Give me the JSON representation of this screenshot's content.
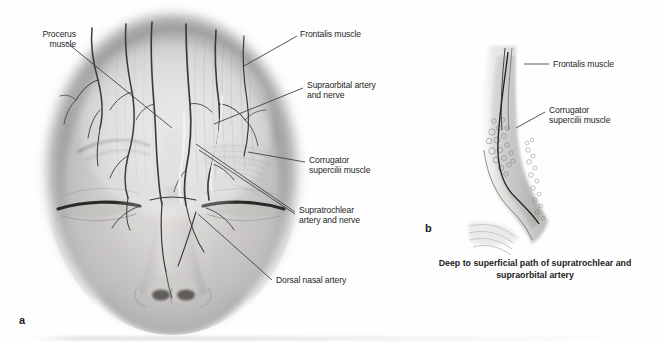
{
  "figure": {
    "background_color": "#fefefe",
    "text_color": "#262626",
    "line_color": "#3a3a3a"
  },
  "panel_a": {
    "marker": "a",
    "view": "Frontal view of face with forehead musculature and vasculature",
    "labels": [
      {
        "id": "procerus",
        "text": "Procerus\nmuscle",
        "align": "right"
      },
      {
        "id": "frontalis",
        "text": "Frontalis muscle",
        "align": "left"
      },
      {
        "id": "supraorbital",
        "text": "Supraorbital artery\nand nerve",
        "align": "left"
      },
      {
        "id": "corrugator",
        "text": "Corrugator\nsupercilii muscle",
        "align": "left"
      },
      {
        "id": "supratrochlear",
        "text": "Supratrochlear\nartery and nerve",
        "align": "left"
      },
      {
        "id": "dorsal-nasal",
        "text": "Dorsal nasal artery",
        "align": "left"
      }
    ]
  },
  "panel_b": {
    "marker": "b",
    "view": "Sagittal section of brow showing vessel course",
    "labels": [
      {
        "id": "frontalis-b",
        "text": "Frontalis muscle",
        "align": "left"
      },
      {
        "id": "corrugator-b",
        "text": "Corrugator\nsupercilii muscle",
        "align": "left"
      }
    ],
    "caption": "Deep to superficial path of supratrochlear\nand supraorbital artery"
  }
}
